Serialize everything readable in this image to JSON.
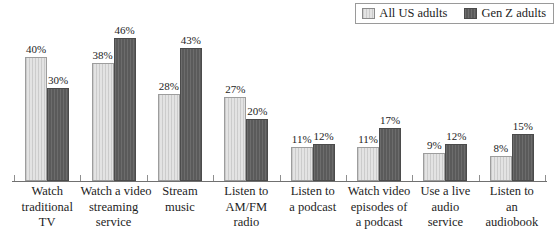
{
  "legend": {
    "entries": [
      {
        "label": "All US adults",
        "color": "#e3e3e3",
        "swatch_name": "legend-swatch-all-us-adults"
      },
      {
        "label": "Gen Z adults",
        "color": "#5a5a5a",
        "swatch_name": "legend-swatch-gen-z-adults"
      }
    ]
  },
  "chart_data": {
    "type": "bar",
    "title": "",
    "subtitle": "",
    "xlabel": "",
    "ylabel": "",
    "ylim": [
      0,
      50
    ],
    "grid": false,
    "legend_position": "top-right",
    "categories": [
      "Watch traditional TV",
      "Watch a video streaming service",
      "Stream music",
      "Listen to AM/FM radio",
      "Listen to a podcast",
      "Watch video episodes of a podcast",
      "Use a live audio service",
      "Listen to an audiobook"
    ],
    "category_label_lines": [
      [
        "Watch",
        "traditional",
        "TV"
      ],
      [
        "Watch a video",
        "streaming",
        "service"
      ],
      [
        "Stream",
        "music"
      ],
      [
        "Listen to",
        "AM/FM",
        "radio"
      ],
      [
        "Listen to",
        "a podcast"
      ],
      [
        "Watch video",
        "episodes of",
        "a podcast"
      ],
      [
        "Use a live",
        "audio",
        "service"
      ],
      [
        "Listen to",
        "an",
        "audiobook"
      ]
    ],
    "series": [
      {
        "name": "All US adults",
        "color": "#e3e3e3",
        "values": [
          40,
          38,
          28,
          27,
          11,
          11,
          9,
          8
        ],
        "data_labels": [
          "40%",
          "38%",
          "28%",
          "27%",
          "11%",
          "11%",
          "9%",
          "8%"
        ]
      },
      {
        "name": "Gen Z adults",
        "color": "#5a5a5a",
        "values": [
          30,
          46,
          43,
          20,
          12,
          17,
          12,
          15
        ],
        "data_labels": [
          "30%",
          "46%",
          "43%",
          "20%",
          "12%",
          "17%",
          "12%",
          "15%"
        ]
      }
    ]
  }
}
